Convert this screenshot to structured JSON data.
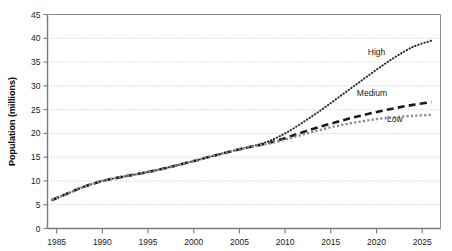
{
  "chart_data": {
    "type": "line",
    "title": "",
    "xlabel": "",
    "ylabel": "Population (millions)",
    "xlim": [
      1984,
      2027
    ],
    "ylim": [
      0,
      45
    ],
    "ytick_step": 5,
    "grid": true,
    "grid_style": "dotted-horizontal",
    "legend": "inline-annotations",
    "yticks": [
      "0",
      "5",
      "10",
      "15",
      "20",
      "25",
      "30",
      "35",
      "40",
      "45"
    ],
    "ytick_values": [
      0,
      5,
      10,
      15,
      20,
      25,
      30,
      35,
      40,
      45
    ],
    "xticks": [
      "1985",
      "1990",
      "1995",
      "2000",
      "2005",
      "2010",
      "2015",
      "2020",
      "2025"
    ],
    "xtick_values": [
      1985,
      1990,
      1995,
      2000,
      2005,
      2010,
      2015,
      2020,
      2025
    ],
    "annotations": [
      {
        "text": "High",
        "x": 2020,
        "y": 36.5
      },
      {
        "text": "Medium",
        "x": 2019.5,
        "y": 27.8
      },
      {
        "text": "Low",
        "x": 2022,
        "y": 22.5
      }
    ],
    "series": [
      {
        "name": "High",
        "style": "dotted",
        "color": "#262626",
        "x": [
          1984.5,
          1986,
          1988,
          1990,
          1992,
          1994,
          1996,
          1998,
          2000,
          2002,
          2004,
          2006,
          2008,
          2010,
          2012,
          2014,
          2016,
          2018,
          2020,
          2022,
          2024,
          2026
        ],
        "values": [
          6.0,
          7.2,
          8.8,
          10.0,
          10.8,
          11.5,
          12.3,
          13.2,
          14.2,
          15.2,
          16.2,
          17.1,
          18.2,
          20.0,
          22.4,
          25.0,
          27.8,
          30.6,
          33.4,
          36.0,
          38.2,
          39.5
        ]
      },
      {
        "name": "Medium",
        "style": "dashed",
        "color": "#1a1a1a",
        "x": [
          1984.5,
          1986,
          1988,
          1990,
          1992,
          1994,
          1996,
          1998,
          2000,
          2002,
          2004,
          2006,
          2008,
          2010,
          2012,
          2014,
          2016,
          2018,
          2020,
          2022,
          2024,
          2026
        ],
        "values": [
          6.0,
          7.2,
          8.8,
          10.0,
          10.8,
          11.5,
          12.3,
          13.2,
          14.2,
          15.2,
          16.2,
          17.1,
          17.9,
          19.0,
          20.3,
          21.5,
          22.6,
          23.6,
          24.5,
          25.3,
          26.0,
          26.6
        ]
      },
      {
        "name": "Low",
        "style": "square-dotted",
        "color": "#8c8c8c",
        "x": [
          1984.5,
          1986,
          1988,
          1990,
          1992,
          1994,
          1996,
          1998,
          2000,
          2002,
          2004,
          2006,
          2008,
          2010,
          2012,
          2014,
          2016,
          2018,
          2020,
          2022,
          2024,
          2026
        ],
        "values": [
          6.0,
          7.2,
          8.8,
          10.0,
          10.8,
          11.5,
          12.3,
          13.2,
          14.2,
          15.2,
          16.2,
          17.1,
          17.8,
          18.7,
          19.8,
          20.8,
          21.7,
          22.4,
          23.0,
          23.4,
          23.7,
          23.9
        ]
      }
    ]
  },
  "colors": {
    "axis": "#808080",
    "grid": "#b3b3b3",
    "text": "#1a1a1a",
    "background": "#ffffff"
  }
}
